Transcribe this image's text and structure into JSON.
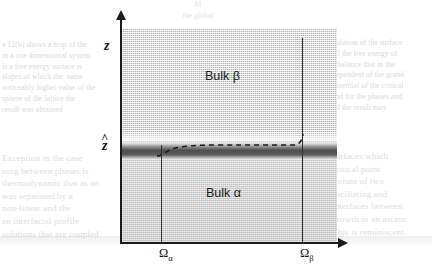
{
  "figure": {
    "axes": {
      "y_label": "z",
      "y_axis_name": "vertical-coordinate-axis",
      "x_axis_name": "lateral-coordinate-axis",
      "interface_level_label": "z",
      "interface_level_accent": "^"
    },
    "regions": [
      {
        "key": "beta",
        "label": "Bulk β",
        "position": "upper"
      },
      {
        "key": "alpha",
        "label": "Bulk α",
        "position": "lower"
      }
    ],
    "tick_labels": {
      "left": {
        "symbol": "Ω",
        "subscript": "α"
      },
      "right": {
        "symbol": "Ω",
        "subscript": "β"
      }
    },
    "annotations": {
      "dashed_curve": "interfacial-profile",
      "drop_line_left": "omega-alpha-boundary",
      "drop_line_right": "omega-beta-boundary"
    },
    "colors": {
      "axis": "#1c1c1c",
      "interface": "#4e4e4e",
      "bulk_beta": "#dcdcdc",
      "bulk_alpha": "#d3d3d3",
      "text": "#111111"
    }
  },
  "page_bleed": {
    "top": "M\nthe global",
    "left_upper": [
      "a 12(b) shows a map of the",
      "in a one dimensional system",
      "is a free energy surface is",
      "slopes of which the  same",
      "noticeably higher value of the",
      "sphere of the lattice the",
      "result was obtained"
    ],
    "left_lower": [
      "Exception in the case",
      "ning between phases is",
      "thermodynamic that as an",
      "was separated by a",
      "non-linear and the",
      "an interfacial profile",
      "solutions that are coupled"
    ],
    "right_upper": [
      "pulation of the surface",
      "all the free energy of",
      "a balance that in the",
      "dependent of the grand",
      "potential of the critical",
      "and for the phases and",
      "all the result may"
    ],
    "right_lower": [
      "surfaces which",
      "critical point",
      "ibrium of two",
      "oscillating and",
      "interfaces between",
      "growth or an ascent",
      "This is reminiscent"
    ]
  }
}
